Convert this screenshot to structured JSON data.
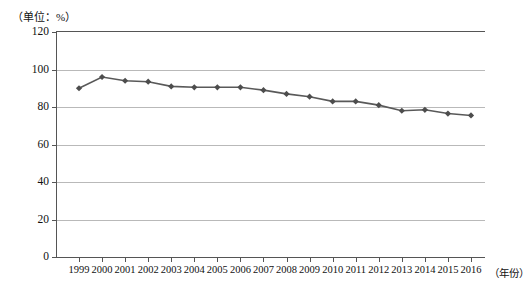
{
  "unit_label": "（单位：%）",
  "x_axis_title": "（年份）",
  "axis": {
    "y_ticks": [
      "0",
      "20",
      "40",
      "60",
      "80",
      "100",
      "120"
    ],
    "x_ticks": [
      "1999",
      "2000",
      "2001",
      "2002",
      "2003",
      "2004",
      "2005",
      "2006",
      "2007",
      "2008",
      "2009",
      "2010",
      "2011",
      "2012",
      "2013",
      "2014",
      "2015",
      "2016"
    ]
  },
  "style": {
    "line_color": "#595959",
    "marker_color": "#4d4d4d",
    "grid_color": "#b9b9b9",
    "axis_color": "#555555"
  },
  "chart_data": {
    "type": "line",
    "title": "",
    "xlabel": "（年份）",
    "ylabel": "（单位：%）",
    "ylim": [
      0,
      120
    ],
    "ytick_interval": 20,
    "grid": true,
    "legend": false,
    "categories": [
      "1999",
      "2000",
      "2001",
      "2002",
      "2003",
      "2004",
      "2005",
      "2006",
      "2007",
      "2008",
      "2009",
      "2010",
      "2011",
      "2012",
      "2013",
      "2014",
      "2015",
      "2016"
    ],
    "values": [
      90,
      96,
      94,
      93.5,
      91,
      90.5,
      90.5,
      90.5,
      89,
      87,
      85.5,
      83,
      83,
      81,
      78,
      78.5,
      76.5,
      75.5
    ]
  }
}
